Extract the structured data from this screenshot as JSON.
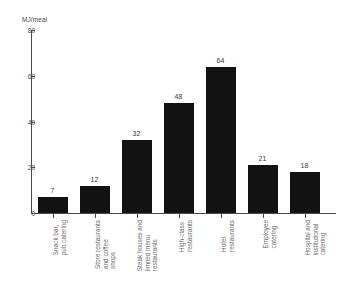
{
  "chart_data": {
    "type": "bar",
    "title": "",
    "subtitle": "",
    "xlabel": "",
    "ylabel": "MJ/meal",
    "ylim": [
      0,
      80
    ],
    "yticks": [
      0,
      20,
      40,
      60,
      80
    ],
    "grid": false,
    "legend": false,
    "bar_color": "#121212",
    "axis_color": "#4a4a4a",
    "label_color": "#6b6b6b",
    "background": "#ffffff",
    "categories": [
      "Snack bar, pub catering",
      "Store restaurants and coffee shops",
      "Steak houses and limited menu restaurants",
      "High-class restaurants",
      "Hotel restaurants",
      "Employee catering",
      "Hospital and institutional catering"
    ],
    "category_lines": [
      [
        "Snack bar,",
        "pub catering"
      ],
      [
        "Store restaurants",
        "and coffee",
        "shops"
      ],
      [
        "Steak houses and",
        "limited menu",
        "restaurants"
      ],
      [
        "High-class",
        "restaurants"
      ],
      [
        "Hotel",
        "restaurants"
      ],
      [
        "Employee",
        "catering"
      ],
      [
        "Hospital and",
        "institutional",
        "catering"
      ]
    ],
    "values": [
      7,
      12,
      32,
      48,
      64,
      21,
      18
    ],
    "value_labels": [
      "7",
      "12",
      "32",
      "48",
      "64",
      "21",
      "18"
    ]
  }
}
